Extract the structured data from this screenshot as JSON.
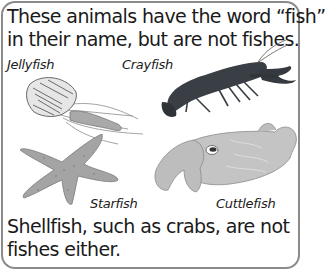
{
  "title": {
    "line1": "These animals have the word “fish”",
    "line2": "in their name, but are not fishes."
  },
  "labels": {
    "jellyfish": "Jellyfish",
    "crayfish": "Crayfish",
    "starfish": "Starfish",
    "cuttlefish": "Cuttlefish"
  },
  "footer": {
    "line1": "Shellfish, such as crabs, are not",
    "line2": "fishes either."
  },
  "colors": {
    "border": "#8a8a8a",
    "text": "#1a1a1a",
    "crayfish": "#3a3f45",
    "starfish": "#9a9a9a",
    "cuttlefish": "#bdbdbd",
    "jellyfish": "#6b6b6b"
  }
}
